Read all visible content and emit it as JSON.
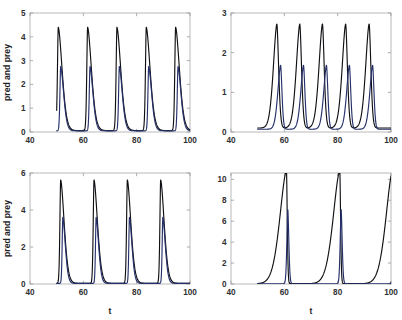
{
  "figure": {
    "background": "#ffffff",
    "frame_color": "#b9b9bb",
    "panel_count": 4
  },
  "chart_data": [
    {
      "panel": "top-left",
      "type": "line",
      "title": "",
      "xlabel": "",
      "ylabel": "pred and prey",
      "xlim": [
        40,
        100
      ],
      "ylim": [
        0,
        5
      ],
      "xticks": [
        40,
        60,
        80,
        100
      ],
      "yticks": [
        0,
        1,
        2,
        3,
        4,
        5
      ],
      "grid": false,
      "legend": "none",
      "data_start_t": 50,
      "series": [
        {
          "name": "predator",
          "color": "#101014",
          "peak_value": 4.4,
          "baseline": 0.06,
          "peak_times": [
            50.6,
            61.6,
            72.6,
            83.6,
            94.6
          ],
          "period": 11.0,
          "rise_width": 0.45,
          "decay_width": 2.1
        },
        {
          "name": "prey",
          "color": "#26306a",
          "peak_value": 2.75,
          "baseline": 0.05,
          "peak_times": [
            51.5,
            62.5,
            73.5,
            84.5,
            95.5
          ],
          "period": 11.0,
          "rise_width": 0.4,
          "decay_width": 1.6
        }
      ]
    },
    {
      "panel": "top-right",
      "type": "line",
      "title": "",
      "xlabel": "",
      "ylabel": "",
      "xlim": [
        40,
        100
      ],
      "ylim": [
        0,
        3
      ],
      "xticks": [
        40,
        60,
        80,
        100
      ],
      "yticks": [
        0,
        1,
        2,
        3
      ],
      "grid": false,
      "legend": "none",
      "data_start_t": 50,
      "series": [
        {
          "name": "predator",
          "color": "#101014",
          "peak_value": 2.72,
          "baseline": 0.1,
          "peak_times": [
            57.2,
            65.8,
            74.3,
            83.0,
            91.8
          ],
          "period": 8.65,
          "rise_width": 1.9,
          "decay_width": 0.95
        },
        {
          "name": "prey",
          "color": "#26306a",
          "peak_value": 1.68,
          "baseline": 0.07,
          "peak_times": [
            58.6,
            67.2,
            75.8,
            84.4,
            93.1
          ],
          "period": 8.65,
          "rise_width": 1.5,
          "decay_width": 0.75
        }
      ]
    },
    {
      "panel": "bottom-left",
      "type": "line",
      "title": "",
      "xlabel": "t",
      "ylabel": "pred and prey",
      "xlim": [
        40,
        100
      ],
      "ylim": [
        0,
        6
      ],
      "xticks": [
        40,
        60,
        80,
        100
      ],
      "yticks": [
        0,
        2,
        4,
        6
      ],
      "grid": false,
      "legend": "none",
      "data_start_t": 50,
      "series": [
        {
          "name": "predator",
          "color": "#101014",
          "peak_value": 5.62,
          "baseline": 0.04,
          "peak_times": [
            51.5,
            64.0,
            76.5,
            89.0
          ],
          "period": 12.5,
          "rise_width": 0.42,
          "decay_width": 1.9
        },
        {
          "name": "prey",
          "color": "#26306a",
          "peak_value": 3.6,
          "baseline": 0.035,
          "peak_times": [
            52.3,
            64.8,
            77.3,
            89.8
          ],
          "period": 12.5,
          "rise_width": 0.35,
          "decay_width": 1.35
        }
      ]
    },
    {
      "panel": "bottom-right",
      "type": "line",
      "title": "",
      "xlabel": "t",
      "ylabel": "",
      "xlim": [
        40,
        100
      ],
      "ylim": [
        0,
        10.6
      ],
      "xticks": [
        40,
        60,
        80,
        100
      ],
      "yticks": [
        0,
        2,
        4,
        6,
        8,
        10
      ],
      "grid": false,
      "legend": "none",
      "data_start_t": 50,
      "series": [
        {
          "name": "predator",
          "color": "#101014",
          "peak_value": 10.8,
          "baseline": 0.03,
          "peak_times": [
            60.8,
            80.8,
            100.6
          ],
          "period": 20.0,
          "rise_width": 3.6,
          "decay_width": 0.42
        },
        {
          "name": "prey",
          "color": "#26306a",
          "peak_value": 7.1,
          "baseline": 0.025,
          "peak_times": [
            61.3,
            81.3,
            101.1
          ],
          "period": 20.0,
          "rise_width": 0.5,
          "decay_width": 0.55
        }
      ]
    }
  ]
}
